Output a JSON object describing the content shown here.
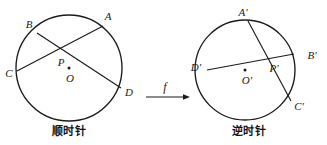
{
  "figure": {
    "width": 327,
    "height": 145,
    "background": "#ffffff",
    "stroke_color": "#1a1a1a",
    "text_color": "#1a1a1a"
  },
  "mapping": {
    "label": "f",
    "arrow_name": "transformation-arrow"
  },
  "left_diagram": {
    "caption": "顺时针",
    "circle": {
      "cx": 69,
      "cy": 68,
      "r": 53
    },
    "center_label": "O",
    "center_point": {
      "x": 69,
      "y": 68
    },
    "intersection_label": "P",
    "intersection_point": {
      "x": 63,
      "y": 52
    },
    "points": [
      {
        "name": "A",
        "label": "A",
        "x": 103,
        "y": 26,
        "label_x": 108,
        "label_y": 16
      },
      {
        "name": "B",
        "label": "B",
        "x": 37,
        "y": 33,
        "label_x": 29,
        "label_y": 24
      },
      {
        "name": "C",
        "label": "C",
        "x": 17,
        "y": 71,
        "label_x": 9,
        "label_y": 73
      },
      {
        "name": "D",
        "label": "D",
        "x": 121,
        "y": 88,
        "label_x": 129,
        "label_y": 92
      }
    ],
    "chords": [
      {
        "name": "chord-AC",
        "from": "A",
        "to": "C"
      },
      {
        "name": "chord-BD",
        "from": "B",
        "to": "D"
      }
    ]
  },
  "right_diagram": {
    "caption": "逆时针",
    "circle": {
      "cx": 245,
      "cy": 70,
      "r": 50
    },
    "center_label": "O'",
    "center_point": {
      "x": 245,
      "y": 70
    },
    "intersection_label": "P'",
    "intersection_point": {
      "x": 270,
      "y": 63
    },
    "points": [
      {
        "name": "A-prime",
        "label": "A'",
        "x": 248,
        "y": 21,
        "label_x": 243,
        "label_y": 12
      },
      {
        "name": "B-prime",
        "label": "B'",
        "x": 294,
        "y": 54,
        "label_x": 312,
        "label_y": 55
      },
      {
        "name": "C-prime",
        "label": "C'",
        "x": 291,
        "y": 101,
        "label_x": 299,
        "label_y": 106
      },
      {
        "name": "D-prime",
        "label": "D'",
        "x": 207,
        "y": 70,
        "label_x": 196,
        "label_y": 67
      }
    ],
    "chords": [
      {
        "name": "chord-A-prime-C-prime",
        "from": "A'",
        "to": "C'"
      },
      {
        "name": "chord-D-prime-B-prime",
        "from": "D'",
        "to": "B'"
      }
    ]
  }
}
